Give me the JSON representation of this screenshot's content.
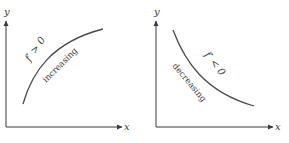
{
  "panels": [
    {
      "name": "increasing-panel",
      "x_axis_label": "x",
      "y_axis_label": "y",
      "condition": "f′ > 0",
      "description": "increasing",
      "curve": "concave-down increasing"
    },
    {
      "name": "decreasing-panel",
      "x_axis_label": "x",
      "y_axis_label": "y",
      "condition": "f′ < 0",
      "description": "decreasing",
      "curve": "concave-up decreasing"
    }
  ],
  "colors": {
    "axis": "#3a3a3a",
    "curve": "#4a4a4a",
    "background": "#ffffff"
  }
}
